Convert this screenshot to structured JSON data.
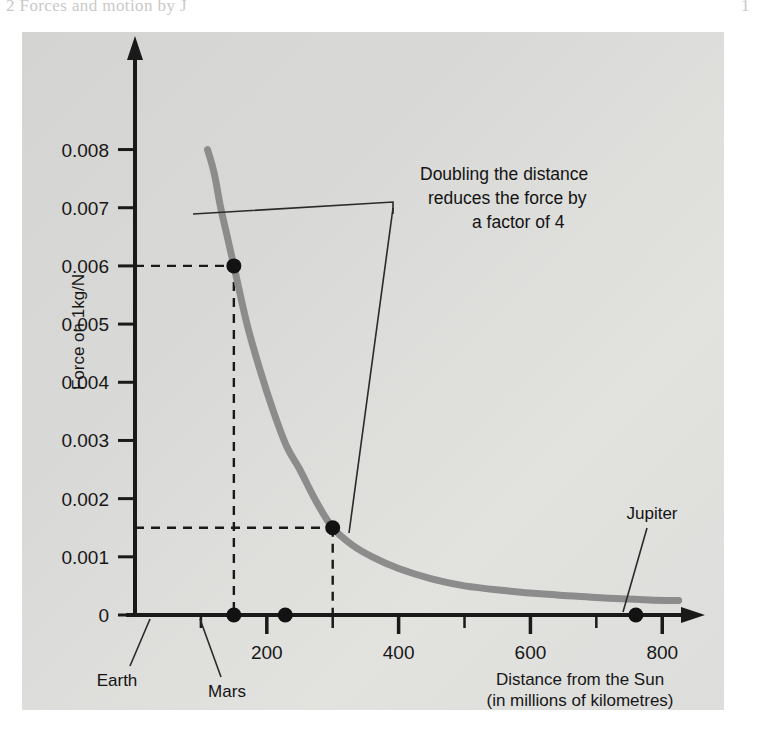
{
  "page": {
    "crop_text_left": "2   Forces and motion  by J",
    "crop_text_right": "1"
  },
  "chart_data": {
    "type": "line",
    "title": "",
    "xlabel": "Distance from the Sun",
    "xlabel_sub": "(in millions of kilometres)",
    "ylabel": "Force on 1kg/N",
    "xlim": [
      0,
      830
    ],
    "ylim": [
      0,
      0.0088
    ],
    "grid": false,
    "legend": null,
    "x_ticks_major": [
      200,
      400,
      600,
      800
    ],
    "x_ticks_major_labels": [
      "200",
      "400",
      "600",
      "800"
    ],
    "x_ticks_minor": [
      100,
      300,
      500,
      700
    ],
    "y_ticks": [
      0,
      0.001,
      0.002,
      0.003,
      0.004,
      0.005,
      0.006,
      0.007,
      0.008
    ],
    "y_tick_labels": [
      "0",
      "0.001",
      "0.002",
      "0.003",
      "0.004",
      "0.005",
      "0.006",
      "0.007",
      "0.008"
    ],
    "curve_name": "inverse-square gravitational force",
    "x": [
      110,
      120,
      130,
      140,
      150,
      170,
      190,
      210,
      230,
      250,
      275,
      300,
      330,
      360,
      400,
      450,
      500,
      560,
      620,
      700,
      780,
      825
    ],
    "y": [
      0.008,
      0.0076,
      0.007,
      0.0065,
      0.006,
      0.005,
      0.0042,
      0.0035,
      0.0029,
      0.0025,
      0.00195,
      0.0015,
      0.0012,
      0.001,
      0.0008,
      0.00062,
      0.0005,
      0.00042,
      0.00036,
      0.0003,
      0.00026,
      0.00025
    ],
    "curve_color": "#8c8c8c",
    "markers": [
      {
        "name": "point-at-earth-distance",
        "x": 150,
        "y": 0.006,
        "guide": "both"
      },
      {
        "name": "point-at-double-distance",
        "x": 300,
        "y": 0.0015,
        "guide": "both"
      },
      {
        "name": "earth-marker",
        "x": 150,
        "y": 0,
        "guide": "none"
      },
      {
        "name": "mars-marker",
        "x": 228,
        "y": 0,
        "guide": "none"
      },
      {
        "name": "jupiter-marker",
        "x": 760,
        "y": 0,
        "guide": "none"
      }
    ],
    "point_labels": [
      {
        "name": "earth",
        "text": "Earth"
      },
      {
        "name": "mars",
        "text": "Mars"
      },
      {
        "name": "jupiter",
        "text": "Jupiter"
      }
    ],
    "annotation": {
      "line1": "Doubling the distance",
      "line2": "reduces the force by",
      "line3": "a factor of 4",
      "points_to": [
        [
          150,
          0.006
        ],
        [
          300,
          0.0015
        ]
      ]
    }
  },
  "colors": {
    "panel_bg": "#dcdcda",
    "axis": "#1a1a1a",
    "curve": "#8c8c8c",
    "text": "#141414"
  }
}
